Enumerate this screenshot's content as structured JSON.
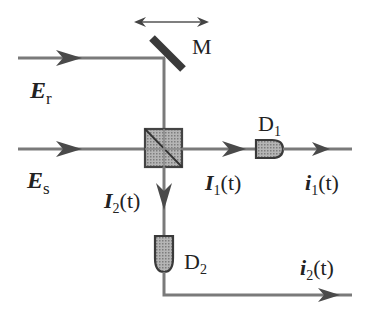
{
  "colors": {
    "beam": "#7a7a7a",
    "component_fill": "#9a9a9a",
    "component_stroke": "#444444",
    "text": "#222222"
  },
  "labels": {
    "mirror": "M",
    "reference_field": {
      "symbol": "E",
      "sub": "r"
    },
    "signal_field": {
      "symbol": "E",
      "sub": "s"
    },
    "detector1": {
      "symbol": "D",
      "sub": "1"
    },
    "detector2": {
      "symbol": "D",
      "sub": "2"
    },
    "intensity1": {
      "symbol": "I",
      "sub": "1",
      "arg": "(t)"
    },
    "intensity2": {
      "symbol": "I",
      "sub": "2",
      "arg": "(t)"
    },
    "current1": {
      "symbol": "i",
      "sub": "1",
      "arg": "(t)"
    },
    "current2": {
      "symbol": "i",
      "sub": "2",
      "arg": "(t)"
    }
  },
  "components": [
    {
      "name": "movable-mirror",
      "label": "M",
      "motion": "horizontal double arrow"
    },
    {
      "name": "beam-splitter-cube"
    },
    {
      "name": "photodetector-1",
      "label": "D1"
    },
    {
      "name": "photodetector-2",
      "label": "D2"
    }
  ]
}
